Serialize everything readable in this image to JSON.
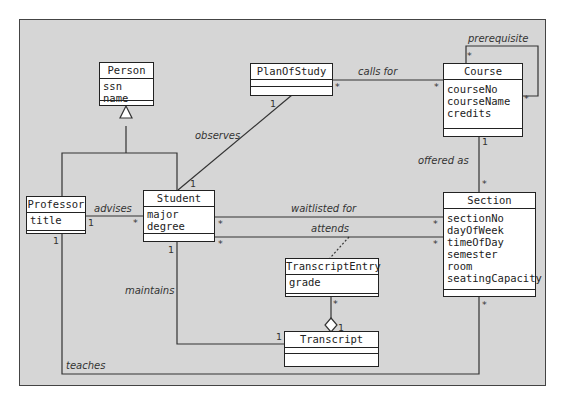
{
  "diagram": {
    "type": "UML class diagram",
    "classes": {
      "person": {
        "name": "Person",
        "attributes": [
          "ssn",
          "name"
        ]
      },
      "plan_of_study": {
        "name": "PlanOfStudy",
        "attributes": []
      },
      "course": {
        "name": "Course",
        "attributes": [
          "courseNo",
          "courseName",
          "credits"
        ]
      },
      "professor": {
        "name": "Professor",
        "attributes": [
          "title"
        ]
      },
      "student": {
        "name": "Student",
        "attributes": [
          "major",
          "degree"
        ]
      },
      "section": {
        "name": "Section",
        "attributes": [
          "sectionNo",
          "dayOfWeek",
          "timeOfDay",
          "semester",
          "room",
          "seatingCapacity"
        ]
      },
      "transcript_entry": {
        "name": "TranscriptEntry",
        "attributes": [
          "grade"
        ]
      },
      "transcript": {
        "name": "Transcript",
        "attributes": []
      }
    },
    "associations": {
      "prerequisite": {
        "label": "prerequisite",
        "mult_a": "*",
        "mult_b": "*"
      },
      "calls_for": {
        "label": "calls for",
        "mult_a": "*",
        "mult_b": "*"
      },
      "observes": {
        "label": "observes",
        "mult_a": "1",
        "mult_b": "1"
      },
      "offered_as": {
        "label": "offered as",
        "mult_a": "1",
        "mult_b": "*"
      },
      "advises": {
        "label": "advises",
        "mult_a": "1",
        "mult_b": "*"
      },
      "waitlisted_for": {
        "label": "waitlisted for",
        "mult_a": "*",
        "mult_b": "*"
      },
      "attends": {
        "label": "attends",
        "mult_a": "*",
        "mult_b": "*"
      },
      "maintains": {
        "label": "maintains",
        "mult_a": "1",
        "mult_b": "1"
      },
      "aggregation": {
        "mult_a": "*",
        "mult_b": "1"
      },
      "teaches": {
        "label": "teaches",
        "mult_a": "1",
        "mult_b": "*"
      }
    }
  }
}
